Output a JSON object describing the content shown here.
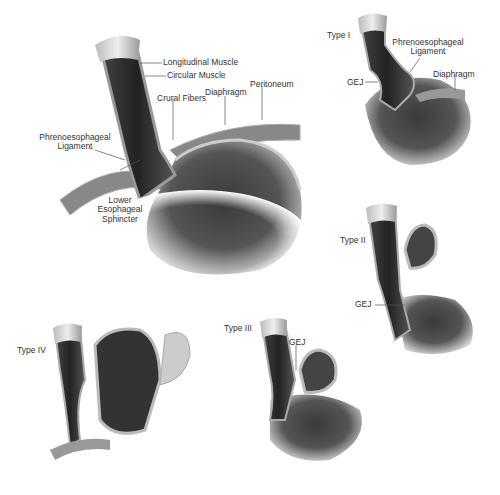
{
  "figure": {
    "main_panel": {
      "labels": {
        "longitudinal_muscle": "Longitudinal Muscle",
        "circular_muscle": "Circular Muscle",
        "crural_fibers": "Crural Fibers",
        "diaphragm": "Diaphragm",
        "peritoneum": "Peritoneum",
        "phrenoesophageal_ligament_1": "Phrenoesophageal",
        "phrenoesophageal_ligament_2": "Ligament",
        "les_1": "Lower",
        "les_2": "Esophageal",
        "les_3": "Sphincter"
      }
    },
    "type_panels": [
      {
        "type": "Type I",
        "labels": {
          "ligament_1": "Phrenoesophageal",
          "ligament_2": "Ligament",
          "gej": "GEJ",
          "diaphragm": "Diaphragm"
        }
      },
      {
        "type": "Type II",
        "labels": {
          "gej": "GEJ"
        }
      },
      {
        "type": "Type III",
        "labels": {
          "gej": "GEJ"
        }
      },
      {
        "type": "Type IV",
        "labels": {}
      }
    ]
  }
}
